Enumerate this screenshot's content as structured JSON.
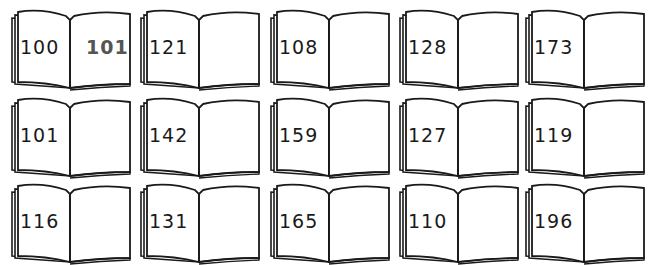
{
  "books": [
    {
      "left_page": "100",
      "right_page": "101"
    },
    {
      "left_page": "121",
      "right_page": ""
    },
    {
      "left_page": "108",
      "right_page": ""
    },
    {
      "left_page": "128",
      "right_page": ""
    },
    {
      "left_page": "173",
      "right_page": ""
    },
    {
      "left_page": "101",
      "right_page": ""
    },
    {
      "left_page": "142",
      "right_page": ""
    },
    {
      "left_page": "159",
      "right_page": ""
    },
    {
      "left_page": "127",
      "right_page": ""
    },
    {
      "left_page": "119",
      "right_page": ""
    },
    {
      "left_page": "116",
      "right_page": ""
    },
    {
      "left_page": "131",
      "right_page": ""
    },
    {
      "left_page": "165",
      "right_page": ""
    },
    {
      "left_page": "110",
      "right_page": ""
    },
    {
      "left_page": "196",
      "right_page": ""
    }
  ],
  "colors": {
    "ink": "#1a1a1a",
    "highlight_number": "#555555",
    "paper": "#ffffff"
  }
}
